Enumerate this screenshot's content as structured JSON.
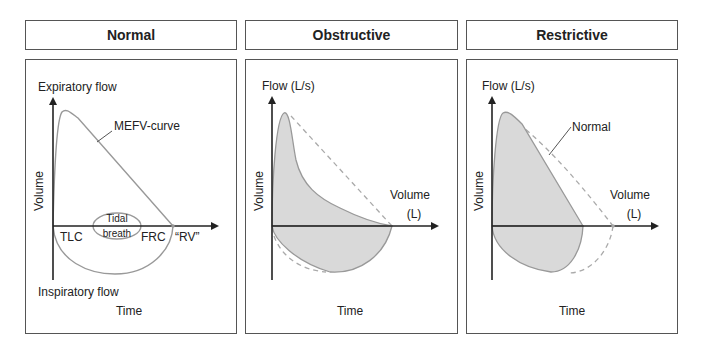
{
  "panels": [
    {
      "title": "Normal",
      "y_top_label": "Expiratory flow",
      "y_bottom_label": "Inspiratory flow",
      "y_axis_label": "Volume",
      "x_axis_label": "Time",
      "curve_label": "MEFV-curve",
      "tidal_label_1": "Tidal",
      "tidal_label_2": "breath",
      "points": [
        "TLC",
        "FRC",
        "“RV”"
      ]
    },
    {
      "title": "Obstructive",
      "y_top_label": "Flow (L/s)",
      "y_axis_label": "Volume",
      "x_axis_label": "Time",
      "x_end_label_1": "Volume",
      "x_end_label_2": "(L)"
    },
    {
      "title": "Restrictive",
      "y_top_label": "Flow (L/s)",
      "y_axis_label": "Volume",
      "x_axis_label": "Time",
      "x_end_label_1": "Volume",
      "x_end_label_2": "(L)",
      "reference_label": "Normal"
    }
  ],
  "colors": {
    "axis": "#222222",
    "curve": "#999999",
    "fill": "#d9d9d9",
    "dashed": "#aaaaaa",
    "border": "#555555"
  }
}
